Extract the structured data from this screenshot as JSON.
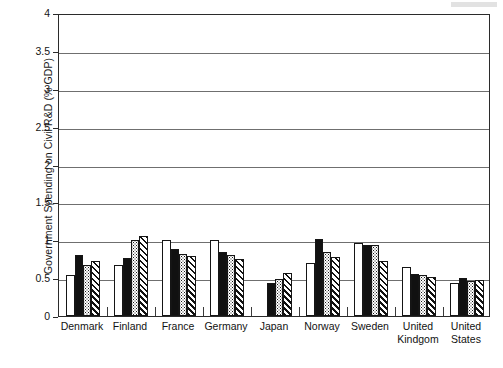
{
  "chart_data": {
    "type": "bar",
    "title": "",
    "subtitle": "",
    "xlabel": "",
    "ylabel": "Government Spending on Civil R&D (% GDP)",
    "ylim": [
      0,
      4
    ],
    "ytick_labels": [
      "0",
      "0.5",
      "1",
      "1.5",
      "2",
      "2.5",
      "3",
      "3.5",
      "4"
    ],
    "ytick_values": [
      0,
      0.5,
      1,
      1.5,
      2,
      2.5,
      3,
      3.5,
      4
    ],
    "grid": true,
    "legend": "none",
    "categories": [
      "Denmark",
      "Finland",
      "France",
      "Germany",
      "Japan",
      "Norway",
      "Sweden",
      "United Kindgom",
      "United States"
    ],
    "category_lines": [
      [
        "Denmark",
        ""
      ],
      [
        "Finland",
        ""
      ],
      [
        "France",
        ""
      ],
      [
        "Germany",
        ""
      ],
      [
        "Japan",
        ""
      ],
      [
        "Norway",
        ""
      ],
      [
        "Sweden",
        ""
      ],
      [
        "United",
        "Kindgom"
      ],
      [
        "United",
        "States"
      ]
    ],
    "series": [
      {
        "name": "series-1",
        "pattern": "white",
        "values": [
          0.54,
          0.68,
          1.0,
          1.01,
          0.0,
          0.7,
          0.96,
          0.65,
          0.44
        ]
      },
      {
        "name": "series-2",
        "pattern": "black",
        "values": [
          0.8,
          0.77,
          0.89,
          0.84,
          0.44,
          1.02,
          0.94,
          0.56,
          0.5
        ]
      },
      {
        "name": "series-3",
        "pattern": "dotted",
        "values": [
          0.67,
          1.0,
          0.82,
          0.8,
          0.49,
          0.85,
          0.94,
          0.54,
          0.46
        ]
      },
      {
        "name": "series-4",
        "pattern": "hatched",
        "values": [
          0.72,
          1.05,
          0.79,
          0.75,
          0.57,
          0.78,
          0.73,
          0.51,
          0.47
        ]
      }
    ]
  }
}
